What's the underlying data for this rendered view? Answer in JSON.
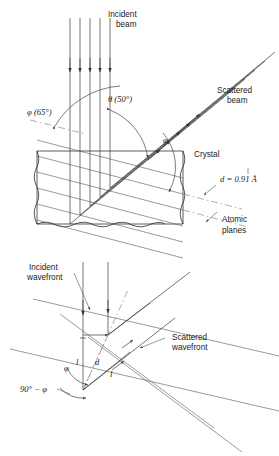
{
  "figure": {
    "name": "bragg-diffraction-diagram",
    "top_panel": {
      "labels": {
        "incident_beam_l1": "Incident",
        "incident_beam_l2": "beam",
        "scattered_beam_l1": "Scattered",
        "scattered_beam_l2": "beam",
        "phi_angle": "φ (65°)",
        "theta_angle": "θ (50°)",
        "phi_interior": "φ",
        "crystal": "Crystal",
        "d_spacing": "d = 0.91 Å",
        "atomic_planes_l1": "Atomic",
        "atomic_planes_l2": "planes"
      }
    },
    "bottom_panel": {
      "labels": {
        "incident_wavefront_l1": "Incident",
        "incident_wavefront_l2": "wavefront",
        "scattered_wavefront_l1": "Scattered",
        "scattered_wavefront_l2": "wavefront",
        "l_left": "l",
        "d_center": "d",
        "l_right": "l",
        "phi": "φ",
        "complement_angle": "90° − φ"
      }
    },
    "colors": {
      "ink": "#1a1a1a",
      "line": "#2b2b2b",
      "plane": "#555555",
      "background": "#ffffff"
    }
  }
}
